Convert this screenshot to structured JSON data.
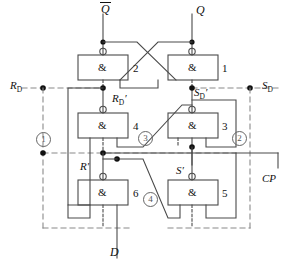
{
  "diagram": {
    "type": "logic-circuit-schematic",
    "colors": {
      "wire": "#4a4a4a",
      "dashed": "#8a8a8a",
      "box_border": "#4a4a4a",
      "text": "#111111",
      "circled_number": "#555555",
      "node_dot": "#111111"
    }
  },
  "gates": [
    {
      "id": "g1",
      "number": "1",
      "symbol": "&",
      "label_side": "right",
      "box": {
        "x": 168,
        "y": 55,
        "w": 50,
        "h": 25
      },
      "inverting_output": true,
      "output_side": "top",
      "inputs": 2
    },
    {
      "id": "g2",
      "number": "2",
      "symbol": "&",
      "label_side": "right",
      "box": {
        "x": 78,
        "y": 55,
        "w": 50,
        "h": 25
      },
      "inverting_output": true,
      "output_side": "top",
      "inputs": 2
    },
    {
      "id": "g3",
      "number": "3",
      "symbol": "&",
      "label_side": "right",
      "box": {
        "x": 168,
        "y": 113,
        "w": 50,
        "h": 25
      },
      "inverting_output": true,
      "output_side": "top",
      "inputs": 3
    },
    {
      "id": "g4",
      "number": "4",
      "symbol": "&",
      "label_side": "right",
      "box": {
        "x": 78,
        "y": 113,
        "w": 50,
        "h": 25
      },
      "inverting_output": true,
      "output_side": "top",
      "inputs": 3
    },
    {
      "id": "g5",
      "number": "5",
      "symbol": "&",
      "label_side": "right",
      "box": {
        "x": 168,
        "y": 180,
        "w": 50,
        "h": 25
      },
      "inverting_output": true,
      "output_side": "top",
      "inputs": 3
    },
    {
      "id": "g6",
      "number": "6",
      "symbol": "&",
      "label_side": "right",
      "box": {
        "x": 78,
        "y": 180,
        "w": 50,
        "h": 25
      },
      "inverting_output": true,
      "output_side": "top",
      "inputs": 3
    }
  ],
  "signals": {
    "q_bar": {
      "text": "Q",
      "overline": true,
      "x": 100,
      "y": 3
    },
    "q": {
      "text": "Q",
      "overline": false,
      "x": 196,
      "y": 3
    },
    "rd": {
      "base": "R",
      "sub": "D",
      "prime": false,
      "x": 10,
      "y": 80
    },
    "sd": {
      "base": "S",
      "sub": "D",
      "prime": false,
      "x": 262,
      "y": 80
    },
    "rd_prime": {
      "base": "R",
      "sub": "D",
      "prime": true,
      "x": 119,
      "y": 94
    },
    "sd_prime": {
      "base": "S",
      "sub": "D",
      "prime": true,
      "x": 196,
      "y": 87
    },
    "r_prime": {
      "base": "R",
      "sub": "",
      "prime": true,
      "x": 82,
      "y": 161
    },
    "s_prime": {
      "base": "S",
      "sub": "",
      "prime": true,
      "x": 177,
      "y": 166
    },
    "cp": {
      "text": "CP",
      "x": 263,
      "y": 174
    },
    "d": {
      "text": "D",
      "x": 110,
      "y": 246
    }
  },
  "circled_numbers": [
    {
      "label": "1",
      "x": 36,
      "y": 132
    },
    {
      "label": "2",
      "x": 232,
      "y": 131
    },
    {
      "label": "3",
      "x": 138,
      "y": 131
    },
    {
      "label": "4",
      "x": 143,
      "y": 192
    }
  ],
  "gate_numbers": [
    {
      "label": "2",
      "x": 133,
      "y": 62
    },
    {
      "label": "1",
      "x": 222,
      "y": 62
    },
    {
      "label": "4",
      "x": 133,
      "y": 120
    },
    {
      "label": "3",
      "x": 222,
      "y": 120
    },
    {
      "label": "6",
      "x": 133,
      "y": 187
    },
    {
      "label": "5",
      "x": 222,
      "y": 187
    }
  ]
}
